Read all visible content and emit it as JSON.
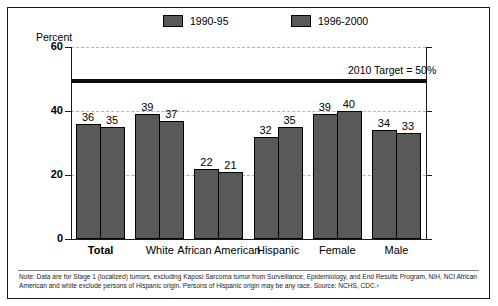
{
  "chart_data": {
    "type": "bar",
    "title": "",
    "xlabel": "",
    "ylabel": "Percent",
    "ylim": [
      0,
      60
    ],
    "yticks": [
      0,
      20,
      40,
      60
    ],
    "grid": true,
    "legend_position": "top",
    "categories": [
      "Total",
      "White",
      "African American",
      "Hispanic",
      "Female",
      "Male"
    ],
    "series": [
      {
        "name": "1990-95",
        "values": [
          36,
          39,
          22,
          32,
          39,
          34
        ],
        "color": "#595959"
      },
      {
        "name": "1996-2000",
        "values": [
          35,
          37,
          21,
          35,
          40,
          33
        ],
        "color": "#595959"
      }
    ],
    "annotations": [
      {
        "name": "target-line",
        "label": "2010 Target = 50%",
        "value": 50
      }
    ]
  },
  "legend": {
    "items": [
      {
        "label": "1990-95"
      },
      {
        "label": "1996-2000"
      }
    ]
  },
  "axis": {
    "y_label": "Percent",
    "y_ticks": [
      "60",
      "40",
      "20",
      "0"
    ]
  },
  "target": {
    "label": "2010 Target = 50%"
  },
  "bars": {
    "groups": [
      {
        "label": "Total",
        "bold": true,
        "v0": "36",
        "v1": "35"
      },
      {
        "label": "White",
        "bold": false,
        "v0": "39",
        "v1": "37"
      },
      {
        "label": "African American",
        "bold": false,
        "v0": "22",
        "v1": "21"
      },
      {
        "label": "Hispanic",
        "bold": false,
        "v0": "32",
        "v1": "35"
      },
      {
        "label": "Female",
        "bold": false,
        "v0": "39",
        "v1": "40"
      },
      {
        "label": "Male",
        "bold": false,
        "v0": "34",
        "v1": "33"
      }
    ]
  },
  "footnote": {
    "text": "Note: Data are for Stage 1 (localized) tumors, excluding Kaposi Sarcoma tumor from Surveillance, Epidemiology, and End Results Program, NIH, NCI African American and white exclude persons of Hispanic origin. Persons of Hispanic origin may be any race. Source: NCHS, CDC.¹"
  }
}
